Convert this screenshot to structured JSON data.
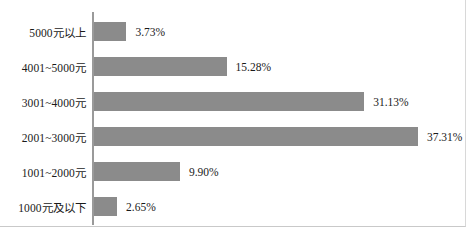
{
  "chart_data": {
    "type": "bar",
    "orientation": "horizontal",
    "title": "",
    "xlabel": "",
    "ylabel": "",
    "xlim": [
      0,
      40
    ],
    "grid": false,
    "legend": null,
    "bar_color": "#8b8b8b",
    "axis_color": "#9a9a9a",
    "value_suffix": "%",
    "categories": [
      "5000元以上",
      "4001~5000元",
      "3001~4000元",
      "2001~3000元",
      "1001~2000元",
      "1000元及以下"
    ],
    "values": [
      3.73,
      15.28,
      31.13,
      37.31,
      9.9,
      2.65
    ],
    "value_labels": [
      "3.73%",
      "15.28%",
      "31.13%",
      "37.31%",
      "9.90%",
      "2.65%"
    ]
  },
  "caption": ""
}
